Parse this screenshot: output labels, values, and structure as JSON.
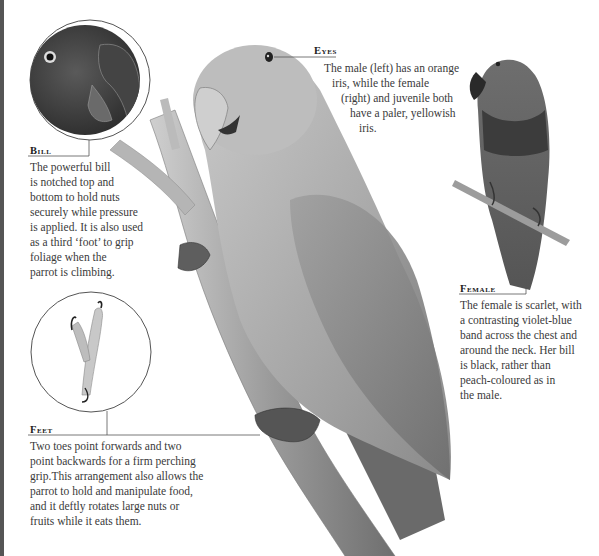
{
  "annotations": {
    "eyes": {
      "heading": "Eyes",
      "lines": [
        "The male (left) has an orange",
        "iris, while the female",
        "(right) and juvenile both",
        "have a paler, yellowish",
        "iris."
      ]
    },
    "bill": {
      "heading": "Bill",
      "lines": [
        "The powerful bill",
        "is notched top and",
        "bottom to hold nuts",
        "securely while pressure",
        "is applied. It is also used",
        "as a third ‘foot’ to grip",
        "foliage when the",
        "parrot is climbing."
      ]
    },
    "female": {
      "heading": "Female",
      "lines": [
        "The female is scarlet, with",
        "a contrasting violet-blue",
        "band across the chest and",
        "around the neck. Her bill",
        "is black, rather than",
        "peach-coloured as in",
        "the male."
      ]
    },
    "feet": {
      "heading": "Feet",
      "lines": [
        "Two toes point forwards and two",
        "point backwards for a firm perching",
        "grip.This arrangement also allows the",
        "parrot to hold and manipulate food,",
        "and it deftly rotates large nuts or",
        "fruits while it eats them."
      ]
    }
  },
  "illustrations": {
    "male": "male-parrot-on-branch",
    "female": "female-parrot-on-twig",
    "bill_inset": "bill-closeup-inset",
    "feet_inset": "foot-closeup-inset"
  },
  "colors": {
    "male_body": "#a8a8a8",
    "female_body": "#6a6a6a",
    "female_band": "#3a3a3a",
    "branch": "#8f8f8f",
    "rule": "#555555"
  }
}
